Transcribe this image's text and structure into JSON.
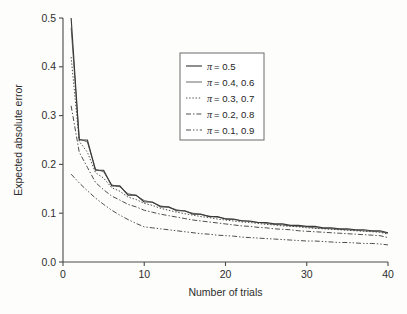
{
  "chart_data": {
    "type": "line",
    "title": "",
    "xlabel": "Number of trials",
    "ylabel": "Expected absolute error",
    "xlim": [
      0,
      40
    ],
    "ylim": [
      0.0,
      0.5
    ],
    "xticks": [
      0,
      10,
      20,
      30,
      40
    ],
    "yticks": [
      "0.0",
      "0.1",
      "0.2",
      "0.3",
      "0.4",
      "0.5"
    ],
    "xtick_labels": [
      "0",
      "10",
      "20",
      "30",
      "40"
    ],
    "ytick_labels": [
      "0.0",
      "0.1",
      "0.2",
      "0.3",
      "0.4",
      "0.5"
    ],
    "grid": false,
    "legend_position": "upper center",
    "x": [
      1,
      2,
      3,
      4,
      5,
      6,
      7,
      8,
      9,
      10,
      11,
      12,
      13,
      14,
      15,
      16,
      17,
      18,
      19,
      20,
      21,
      22,
      23,
      24,
      25,
      26,
      27,
      28,
      29,
      30,
      31,
      32,
      33,
      34,
      35,
      36,
      37,
      38,
      39,
      40
    ],
    "series": [
      {
        "name": "pi-0.5",
        "label": "= 0.5",
        "symbol": "π",
        "linestyle": "solid",
        "values": [
          0.5,
          0.25,
          0.25,
          0.188,
          0.188,
          0.156,
          0.156,
          0.137,
          0.137,
          0.123,
          0.123,
          0.113,
          0.113,
          0.105,
          0.105,
          0.098,
          0.098,
          0.093,
          0.093,
          0.088,
          0.088,
          0.084,
          0.084,
          0.081,
          0.081,
          0.078,
          0.078,
          0.075,
          0.075,
          0.073,
          0.073,
          0.07,
          0.07,
          0.068,
          0.068,
          0.066,
          0.066,
          0.064,
          0.064,
          0.06
        ]
      },
      {
        "name": "pi-0.4-0.6",
        "label": "= 0.4, 0.6",
        "symbol": "π",
        "linestyle": "thin-solid",
        "values": [
          0.48,
          0.252,
          0.246,
          0.19,
          0.185,
          0.158,
          0.154,
          0.14,
          0.136,
          0.126,
          0.122,
          0.115,
          0.112,
          0.107,
          0.104,
          0.1,
          0.097,
          0.094,
          0.092,
          0.089,
          0.087,
          0.085,
          0.083,
          0.081,
          0.079,
          0.077,
          0.076,
          0.074,
          0.073,
          0.072,
          0.07,
          0.069,
          0.068,
          0.067,
          0.066,
          0.065,
          0.064,
          0.063,
          0.062,
          0.059
        ]
      },
      {
        "name": "pi-0.3-0.7",
        "label": "= 0.3, 0.7",
        "symbol": "π",
        "linestyle": "dotted",
        "values": [
          0.42,
          0.247,
          0.225,
          0.183,
          0.172,
          0.152,
          0.145,
          0.133,
          0.128,
          0.12,
          0.116,
          0.11,
          0.106,
          0.102,
          0.099,
          0.096,
          0.093,
          0.091,
          0.088,
          0.086,
          0.084,
          0.082,
          0.081,
          0.079,
          0.077,
          0.076,
          0.074,
          0.073,
          0.072,
          0.07,
          0.069,
          0.068,
          0.067,
          0.066,
          0.065,
          0.064,
          0.063,
          0.062,
          0.061,
          0.057
        ]
      },
      {
        "name": "pi-0.2-0.8",
        "label": "= 0.2, 0.8",
        "symbol": "π",
        "linestyle": "dash-dot",
        "values": [
          0.32,
          0.225,
          0.194,
          0.163,
          0.148,
          0.135,
          0.127,
          0.118,
          0.113,
          0.106,
          0.102,
          0.098,
          0.095,
          0.092,
          0.089,
          0.086,
          0.084,
          0.082,
          0.08,
          0.078,
          0.076,
          0.074,
          0.073,
          0.071,
          0.07,
          0.068,
          0.067,
          0.066,
          0.064,
          0.063,
          0.062,
          0.061,
          0.06,
          0.059,
          0.058,
          0.057,
          0.056,
          0.055,
          0.054,
          0.05
        ]
      },
      {
        "name": "pi-0.1-0.9",
        "label": "= 0.1, 0.9",
        "symbol": "π",
        "linestyle": "dash-dot-dot",
        "values": [
          0.18,
          0.162,
          0.146,
          0.131,
          0.118,
          0.106,
          0.096,
          0.087,
          0.079,
          0.072,
          0.07,
          0.068,
          0.066,
          0.064,
          0.062,
          0.06,
          0.058,
          0.057,
          0.055,
          0.054,
          0.053,
          0.051,
          0.05,
          0.049,
          0.048,
          0.047,
          0.046,
          0.045,
          0.044,
          0.043,
          0.043,
          0.042,
          0.041,
          0.04,
          0.04,
          0.039,
          0.038,
          0.038,
          0.037,
          0.035
        ]
      }
    ]
  },
  "axes": {
    "xlabel": "Number of trials",
    "ylabel": "Expected absolute error"
  },
  "legend": {
    "entries": [
      {
        "symbol": "π",
        "label": "= 0.5",
        "style": "solid"
      },
      {
        "symbol": "π",
        "label": "= 0.4, 0.6",
        "style": "thin-solid"
      },
      {
        "symbol": "π",
        "label": "= 0.3, 0.7",
        "style": "dotted"
      },
      {
        "symbol": "π",
        "label": "= 0.2, 0.8",
        "style": "dash-dot"
      },
      {
        "symbol": "π",
        "label": "= 0.1, 0.9",
        "style": "dash-dot-dot"
      }
    ]
  },
  "colors": {
    "ink": "#3a3a3a",
    "axis": "#4a4a4a",
    "background": "#fdfdfb"
  }
}
